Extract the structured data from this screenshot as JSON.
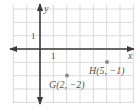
{
  "diagram": {
    "type": "coordinate-plane",
    "grid": {
      "x_min": -2,
      "x_max": 7,
      "y_min": -4,
      "y_max": 3,
      "unit_px": 13.33,
      "origin_px": [
        40,
        49
      ],
      "grid_color": "#d9d9d9",
      "axis_color": "#3a3a3a"
    },
    "axes": {
      "x_label": "x",
      "y_label": "y",
      "x_tick_label": "1",
      "y_tick_label": "1"
    },
    "points": [
      {
        "name": "G",
        "x": 2,
        "y": -2,
        "label": "G(2, −2)",
        "color": "#8a8a8a"
      },
      {
        "name": "H",
        "x": 5,
        "y": -1,
        "label": "H(5, −1)",
        "color": "#8a8a8a"
      }
    ]
  }
}
